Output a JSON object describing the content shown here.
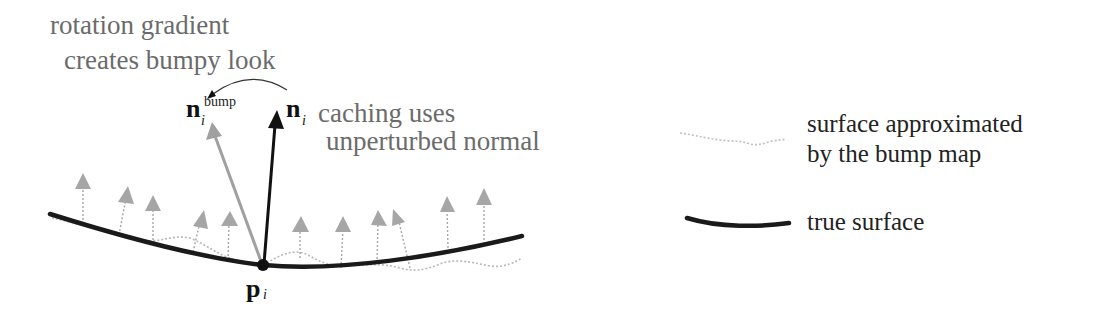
{
  "annotations": {
    "rotation_line1": "rotation gradient",
    "rotation_line2": "creates bumpy look",
    "caching_line1": "caching uses",
    "caching_line2": "unperturbed normal"
  },
  "symbols": {
    "n_bump_base": "n",
    "n_bump_sub": "i",
    "n_bump_sup": "bump",
    "n_base": "n",
    "n_sub": "i",
    "p_base": "p",
    "p_sub": "i"
  },
  "legend": {
    "items": [
      {
        "id": "bump-surface",
        "line1": "surface approximated",
        "line2": "by the bump map",
        "style": "dotted-gray"
      },
      {
        "id": "true-surface",
        "line1": "true surface",
        "style": "thick-black"
      }
    ]
  },
  "colors": {
    "true_surface": "#1a1a1a",
    "bump_surface": "#b8b8b8",
    "bump_normals": "#a6a6a6",
    "n_bump_arrow": "#a0a0a0",
    "n_arrow": "#111111",
    "annotation_text": "#6b6b6b",
    "legend_text": "#222222"
  }
}
